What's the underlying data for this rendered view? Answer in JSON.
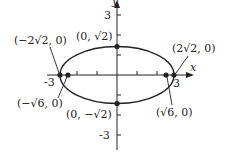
{
  "diagram": {
    "type": "ellipse-graph",
    "equation_context": "ellipse centered at origin with horizontal major axis",
    "axes": {
      "x_label": "x",
      "y_label": "y",
      "x_ticks": [
        "-3",
        "3"
      ],
      "y_ticks": [
        "3",
        "-3"
      ]
    },
    "points": [
      {
        "id": "left-vertex",
        "label": "(−2√2, 0)"
      },
      {
        "id": "right-vertex",
        "label": "(2√2, 0)"
      },
      {
        "id": "top-covertex",
        "label": "(0, √2)"
      },
      {
        "id": "bottom-covertex",
        "label": "(0, −√2)"
      },
      {
        "id": "left-focus",
        "label": "(−√6, 0)"
      },
      {
        "id": "right-focus",
        "label": "(√6, 0)"
      }
    ],
    "colors": {
      "stroke": "#222222",
      "background": "#ffffff"
    }
  }
}
